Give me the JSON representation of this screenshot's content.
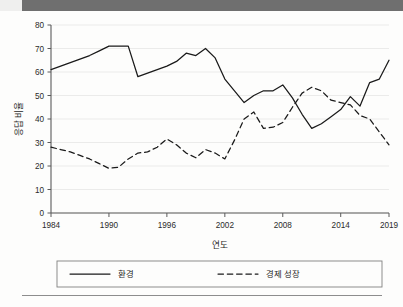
{
  "page": {
    "background_color": "#fdfdfc",
    "scan_bar_color": "#6f6f6f"
  },
  "chart_data": {
    "type": "line",
    "title": "",
    "xlabel": "연도",
    "ylabel": "응답 비율",
    "xlim": [
      1984,
      2019
    ],
    "ylim": [
      0,
      80
    ],
    "grid": true,
    "legend_position": "bottom",
    "xticks": [
      "1984",
      "1990",
      "1996",
      "2002",
      "2008",
      "2014",
      "2019"
    ],
    "xtick_values": [
      1984,
      1990,
      1996,
      2002,
      2008,
      2014,
      2019
    ],
    "yticks": [
      "0",
      "10",
      "20",
      "30",
      "40",
      "50",
      "60",
      "70",
      "80"
    ],
    "ytick_values": [
      0,
      10,
      20,
      30,
      40,
      50,
      60,
      70,
      80
    ],
    "x": [
      1984,
      1985,
      1986,
      1987,
      1988,
      1989,
      1990,
      1991,
      1992,
      1993,
      1994,
      1995,
      1996,
      1997,
      1998,
      1999,
      2000,
      2001,
      2002,
      2003,
      2004,
      2005,
      2006,
      2007,
      2008,
      2009,
      2010,
      2011,
      2012,
      2013,
      2014,
      2015,
      2016,
      2017,
      2018,
      2019
    ],
    "series": [
      {
        "name": "환경",
        "style": "solid",
        "color": "#1a1a1a",
        "values": [
          61,
          62.5,
          64,
          65.5,
          67,
          69,
          71,
          71,
          71,
          58,
          59.5,
          61,
          62.5,
          64.5,
          68,
          67,
          70,
          66,
          57,
          52,
          47,
          50,
          52,
          52,
          54.5,
          49,
          42,
          36,
          38,
          41,
          44,
          49.5,
          45.5,
          55.5,
          57,
          65
        ]
      },
      {
        "name": "경제 성장",
        "style": "dashed",
        "color": "#1a1a1a",
        "values": [
          28,
          27,
          26,
          24.5,
          23,
          21,
          19,
          19.5,
          23,
          25.5,
          26,
          28,
          31.5,
          29,
          25.5,
          23.5,
          27,
          25.5,
          23,
          31,
          40,
          43,
          36,
          36.5,
          38.5,
          45,
          51,
          53.5,
          52,
          48,
          47,
          46,
          41.5,
          40,
          34.5,
          29
        ]
      }
    ]
  },
  "legend": {
    "entries": [
      {
        "label": "환경",
        "style": "solid"
      },
      {
        "label": "경제 성장",
        "style": "dashed"
      }
    ]
  }
}
